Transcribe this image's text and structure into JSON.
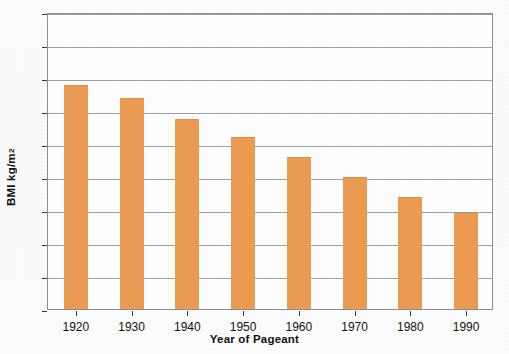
{
  "chart_data": {
    "type": "bar",
    "title": "",
    "xlabel": "Year of Pageant",
    "ylabel": "BMI kg/m",
    "ylabel_sup": "2",
    "categories": [
      "1920",
      "1930",
      "1940",
      "1950",
      "1960",
      "1970",
      "1980",
      "1990"
    ],
    "values": [
      21.8,
      21.4,
      20.75,
      20.2,
      19.6,
      19.0,
      18.4,
      17.9
    ],
    "series": [
      {
        "name": "Miss America BMI",
        "values": [
          21.8,
          21.4,
          20.75,
          20.2,
          19.6,
          19.0,
          18.4,
          17.9
        ]
      }
    ],
    "ylim": [
      15,
      24
    ],
    "yticks": [
      "15",
      "16",
      "17",
      "18",
      "19",
      "20",
      "21",
      "22",
      "23",
      "24"
    ],
    "ytick_values": [
      15,
      16,
      17,
      18,
      19,
      20,
      21,
      22,
      23,
      24
    ],
    "grid": true,
    "legend": "none",
    "bar_color": "#ed9b52",
    "axis_color": "#8d8f91",
    "background_color": "#ffffff"
  }
}
